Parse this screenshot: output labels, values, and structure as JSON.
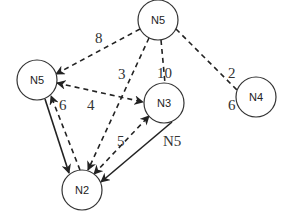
{
  "diagram": {
    "nodes": [
      {
        "id": "n5_top",
        "label": "N5",
        "cx": 158,
        "cy": 20,
        "r": 20
      },
      {
        "id": "n5_left",
        "label": "N5",
        "cx": 37,
        "cy": 80,
        "r": 20
      },
      {
        "id": "n3",
        "label": "N3",
        "cx": 164,
        "cy": 103,
        "r": 20
      },
      {
        "id": "n4",
        "label": "N4",
        "cx": 256,
        "cy": 97,
        "r": 20
      },
      {
        "id": "n2",
        "label": "N2",
        "cx": 82,
        "cy": 190,
        "r": 20
      }
    ],
    "edges": [
      {
        "from": "n5_top",
        "to": "n5_left",
        "style": "dashed",
        "arrow": "end",
        "label": "8"
      },
      {
        "from": "n5_top",
        "to": "n2",
        "style": "dashed",
        "arrow": "end",
        "label": "3"
      },
      {
        "from": "n5_top",
        "to": "n3",
        "style": "dashed",
        "arrow": "none",
        "label": "10"
      },
      {
        "from": "n5_top",
        "to": "n4",
        "style": "dashed",
        "arrow": "none",
        "label": "2"
      },
      {
        "from": "n5_left",
        "to": "n3",
        "style": "dashed",
        "arrow": "both",
        "label": "4"
      },
      {
        "from": "n5_left",
        "to": "n2",
        "style": "solid",
        "arrow": "end",
        "label": ""
      },
      {
        "from": "n2",
        "to": "n5_left",
        "style": "dashed",
        "arrow": "end",
        "label": "6"
      },
      {
        "from": "n2",
        "to": "n3",
        "style": "dashed",
        "arrow": "both",
        "label": "5"
      },
      {
        "from": "n3",
        "to": "n2",
        "style": "solid",
        "arrow": "end",
        "label": "N5"
      }
    ],
    "labels": {
      "n5_top": "N5",
      "n5_left": "N5",
      "n3": "N3",
      "n4": "N4",
      "n2": "N2",
      "e_8": "8",
      "e_3": "3",
      "e_10": "10",
      "e_2": "2",
      "e_6_n4": "6",
      "e_4": "4",
      "e_6": "6",
      "e_5": "5",
      "e_n5": "N5"
    }
  }
}
